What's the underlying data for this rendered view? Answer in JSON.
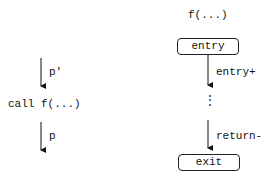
{
  "left": {
    "label_in": "p'",
    "call_label": "call f(...)",
    "label_out": "p"
  },
  "right": {
    "function_title": "f(...)",
    "entry_node": "entry",
    "entry_edge_label": "entry+",
    "ellipsis": "⋮",
    "return_edge_label": "return-",
    "exit_node": "exit"
  }
}
